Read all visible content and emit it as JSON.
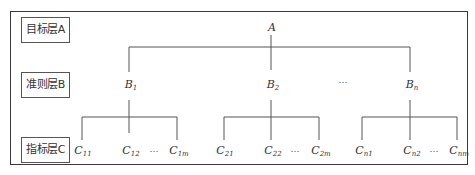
{
  "diagram": {
    "type": "hierarchy",
    "layers": [
      {
        "id": "A",
        "label": "目标层A"
      },
      {
        "id": "B",
        "label": "准则层B"
      },
      {
        "id": "C",
        "label": "指标层C"
      }
    ],
    "root": {
      "name": "A",
      "sub": ""
    },
    "criteria": [
      {
        "name": "B",
        "sub": "1"
      },
      {
        "name": "B",
        "sub": "2"
      },
      {
        "name": "B",
        "sub": "n"
      }
    ],
    "criteria_ellipsis": "…",
    "indicators": [
      {
        "group": "B1",
        "items": [
          {
            "name": "C",
            "sub": "11"
          },
          {
            "name": "C",
            "sub": "12"
          },
          {
            "name": "C",
            "sub": "1m"
          }
        ],
        "ellipsis": "…"
      },
      {
        "group": "B2",
        "items": [
          {
            "name": "C",
            "sub": "21"
          },
          {
            "name": "C",
            "sub": "22"
          },
          {
            "name": "C",
            "sub": "2m"
          }
        ],
        "ellipsis": "…"
      },
      {
        "group": "Bn",
        "items": [
          {
            "name": "C",
            "sub": "n1"
          },
          {
            "name": "C",
            "sub": "n2"
          },
          {
            "name": "C",
            "sub": "nm"
          }
        ],
        "ellipsis": "…"
      }
    ],
    "line_color": "#555555",
    "border_color": "#3a3a3a"
  }
}
